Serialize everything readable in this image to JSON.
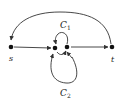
{
  "diagram": {
    "type": "directed-graph",
    "nodes": [
      {
        "id": "s",
        "label": "s"
      },
      {
        "id": "m1",
        "label": ""
      },
      {
        "id": "m2",
        "label": ""
      },
      {
        "id": "t",
        "label": "t"
      }
    ],
    "edges": [
      {
        "from": "s",
        "to": "m1"
      },
      {
        "from": "m2",
        "to": "t"
      },
      {
        "from": "t",
        "to": "s",
        "shape": "arc-over-top"
      },
      {
        "from": "m2",
        "to": "m1",
        "shape": "loop-above",
        "label": "C1"
      },
      {
        "from": "m1",
        "to": "m2",
        "shape": "short-curve-below"
      },
      {
        "from": "m2",
        "to": "m1",
        "shape": "loop-below",
        "label": "C2"
      }
    ],
    "labels": {
      "s": "s",
      "t": "t",
      "c1_main": "C",
      "c1_sub": "1",
      "c2_main": "C",
      "c2_sub": "2"
    },
    "colors": {
      "node": "#111111",
      "edge": "#333333"
    }
  }
}
